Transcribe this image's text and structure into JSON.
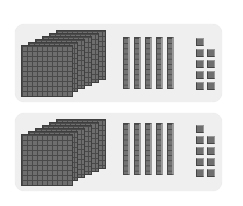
{
  "diagram": {
    "colors": {
      "panel_bg": "#efefef",
      "block": "#6e6e6e",
      "grid_line": "#4a4a4a"
    },
    "panels": [
      {
        "id": "top",
        "hundreds_flats_estimated": 6,
        "tens_rods": 5,
        "units": 9
      },
      {
        "id": "bottom",
        "hundreds_flats_estimated": 6,
        "tens_rods": 5,
        "units": 9
      }
    ]
  }
}
